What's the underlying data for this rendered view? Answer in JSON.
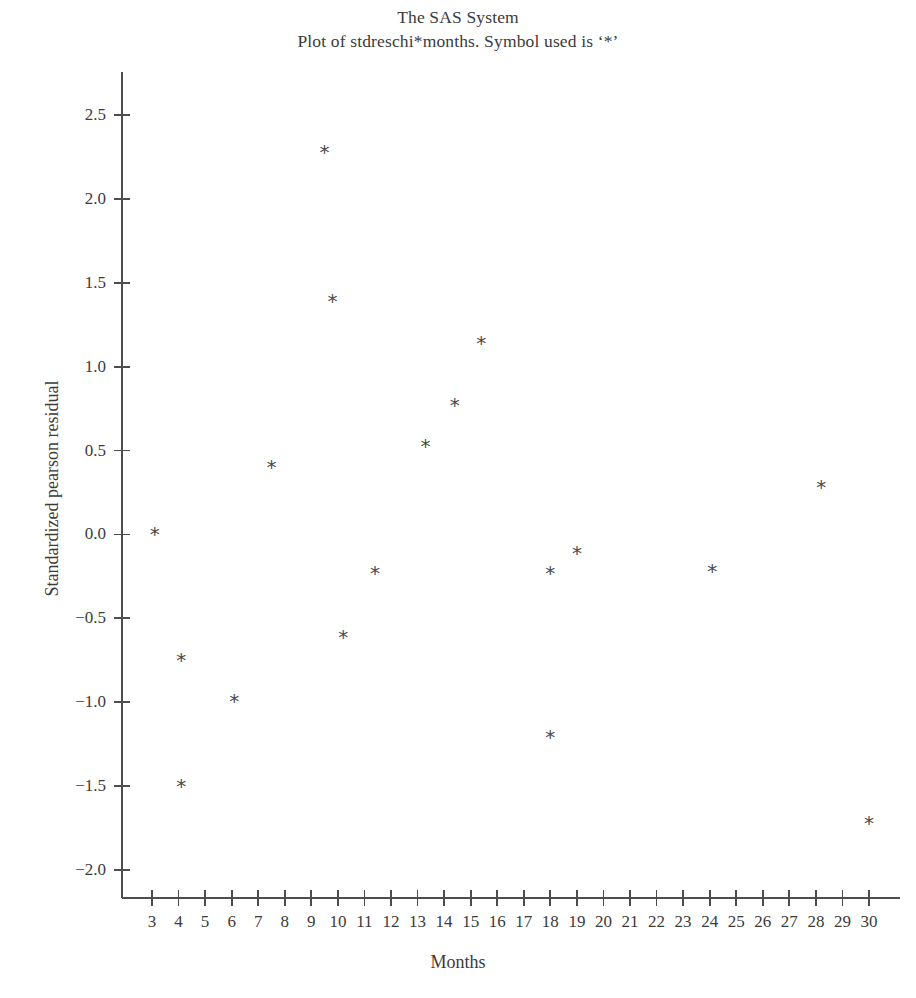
{
  "titles": {
    "line1": "The SAS System",
    "line2": "Plot of stdreschi*months. Symbol used is ‘*’"
  },
  "colors": {
    "axis": "#4d4d4d",
    "text": "#3b3b3b",
    "marker": "#4a4a4a",
    "background": "#ffffff"
  },
  "chart_data": {
    "type": "scatter",
    "title": "The SAS System",
    "subtitle": "Plot of stdreschi*months. Symbol used is ‘*’",
    "xlabel": "Months",
    "ylabel": "Standardized pearson residual",
    "marker_symbol": "*",
    "grid": false,
    "legend": "none",
    "xlim": [
      2.3,
      30.6
    ],
    "ylim": [
      -2.25,
      2.75
    ],
    "xticks": [
      3,
      4,
      5,
      6,
      7,
      8,
      9,
      10,
      11,
      12,
      13,
      14,
      15,
      16,
      17,
      18,
      19,
      20,
      21,
      22,
      23,
      24,
      25,
      26,
      27,
      28,
      29,
      30
    ],
    "xtick_labels": [
      "3",
      "4",
      "5",
      "6",
      "7",
      "8",
      "9",
      "10",
      "11",
      "12",
      "13",
      "14",
      "15",
      "16",
      "17",
      "18",
      "19",
      "20",
      "21",
      "22",
      "23",
      "24",
      "25",
      "26",
      "27",
      "28",
      "29",
      "30"
    ],
    "yticks": [
      2.5,
      2.0,
      1.5,
      1.0,
      0.5,
      0.0,
      -0.5,
      -1.0,
      -1.5,
      -2.0
    ],
    "ytick_labels": [
      "2.5",
      "2.0",
      "1.5",
      "1.0",
      "0.5",
      "0.0",
      "−0.5",
      "−1.0",
      "−1.5",
      "−2.0"
    ],
    "points": [
      {
        "x": 3.1,
        "y": 0.0
      },
      {
        "x": 4.1,
        "y": -0.75
      },
      {
        "x": 4.1,
        "y": -1.5
      },
      {
        "x": 6.1,
        "y": -0.99
      },
      {
        "x": 7.5,
        "y": 0.4
      },
      {
        "x": 9.5,
        "y": 2.28
      },
      {
        "x": 9.8,
        "y": 1.39
      },
      {
        "x": 10.2,
        "y": -0.61
      },
      {
        "x": 11.4,
        "y": -0.23
      },
      {
        "x": 13.3,
        "y": 0.53
      },
      {
        "x": 14.4,
        "y": 0.77
      },
      {
        "x": 15.4,
        "y": 1.14
      },
      {
        "x": 18.0,
        "y": -0.23
      },
      {
        "x": 18.0,
        "y": -1.21
      },
      {
        "x": 19.0,
        "y": -0.11
      },
      {
        "x": 24.1,
        "y": -0.22
      },
      {
        "x": 28.2,
        "y": 0.28
      },
      {
        "x": 30.0,
        "y": -1.72
      }
    ]
  }
}
